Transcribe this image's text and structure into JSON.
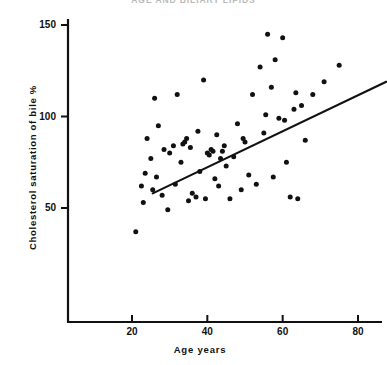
{
  "chart_data": {
    "type": "scatter",
    "title": "AGE AND BILIARY LIPIDS",
    "xlabel": "Age years",
    "ylabel": "Cholesterol saturation of bile  %",
    "xlim": [
      10,
      88
    ],
    "ylim": [
      25,
      158
    ],
    "grid": false,
    "legend": null,
    "xticks": [
      20,
      40,
      60,
      80
    ],
    "xtick_labels": [
      "20",
      "40",
      "60",
      "80"
    ],
    "yticks": [
      50,
      100,
      150
    ],
    "ytick_labels": [
      "50",
      "100",
      "150"
    ],
    "series": [
      {
        "name": "Subjects",
        "marker": "filled-circle",
        "color": "#111111",
        "points": [
          [
            21.0,
            37.0
          ],
          [
            22.5,
            62.0
          ],
          [
            23.0,
            53.0
          ],
          [
            23.5,
            69.0
          ],
          [
            24.0,
            88.0
          ],
          [
            25.0,
            77.0
          ],
          [
            25.5,
            60.0
          ],
          [
            26.0,
            110.0
          ],
          [
            26.5,
            67.0
          ],
          [
            27.0,
            95.0
          ],
          [
            28.0,
            57.0
          ],
          [
            28.5,
            82.0
          ],
          [
            29.5,
            49.0
          ],
          [
            30.0,
            80.0
          ],
          [
            31.0,
            84.0
          ],
          [
            31.5,
            63.0
          ],
          [
            32.0,
            112.0
          ],
          [
            33.0,
            75.0
          ],
          [
            33.5,
            85.0
          ],
          [
            34.0,
            86.0
          ],
          [
            34.5,
            88.0
          ],
          [
            35.0,
            54.0
          ],
          [
            35.5,
            83.0
          ],
          [
            36.0,
            58.0
          ],
          [
            37.0,
            56.0
          ],
          [
            37.5,
            92.0
          ],
          [
            38.0,
            70.0
          ],
          [
            39.0,
            120.0
          ],
          [
            39.5,
            55.0
          ],
          [
            40.0,
            80.0
          ],
          [
            40.5,
            79.0
          ],
          [
            41.0,
            82.0
          ],
          [
            41.5,
            81.0
          ],
          [
            42.0,
            66.0
          ],
          [
            42.5,
            90.0
          ],
          [
            43.0,
            62.0
          ],
          [
            43.5,
            77.0
          ],
          [
            44.0,
            81.0
          ],
          [
            44.5,
            84.0
          ],
          [
            45.0,
            73.0
          ],
          [
            46.0,
            55.0
          ],
          [
            47.0,
            78.0
          ],
          [
            48.0,
            96.0
          ],
          [
            49.0,
            60.0
          ],
          [
            49.5,
            88.0
          ],
          [
            50.0,
            86.0
          ],
          [
            51.0,
            68.0
          ],
          [
            52.0,
            112.0
          ],
          [
            53.0,
            63.0
          ],
          [
            54.0,
            127.0
          ],
          [
            55.0,
            91.0
          ],
          [
            55.5,
            101.0
          ],
          [
            56.0,
            145.0
          ],
          [
            57.0,
            116.0
          ],
          [
            57.5,
            67.0
          ],
          [
            58.0,
            131.0
          ],
          [
            59.0,
            99.0
          ],
          [
            60.0,
            143.0
          ],
          [
            60.5,
            98.0
          ],
          [
            61.0,
            75.0
          ],
          [
            62.0,
            56.0
          ],
          [
            63.0,
            104.0
          ],
          [
            63.5,
            113.0
          ],
          [
            64.0,
            55.0
          ],
          [
            65.0,
            106.0
          ],
          [
            66.0,
            87.0
          ],
          [
            68.0,
            112.0
          ],
          [
            71.0,
            119.0
          ],
          [
            75.0,
            128.0
          ]
        ]
      }
    ],
    "fit_line": {
      "name": "regression-line",
      "color": "#111111",
      "x_start": 25.5,
      "y_start": 58.0,
      "x_end": 87.5,
      "y_end": 119.0
    }
  },
  "axes": {
    "y_axis_name": "y-axis-spine",
    "x_axis_name": "x-axis-spine"
  }
}
